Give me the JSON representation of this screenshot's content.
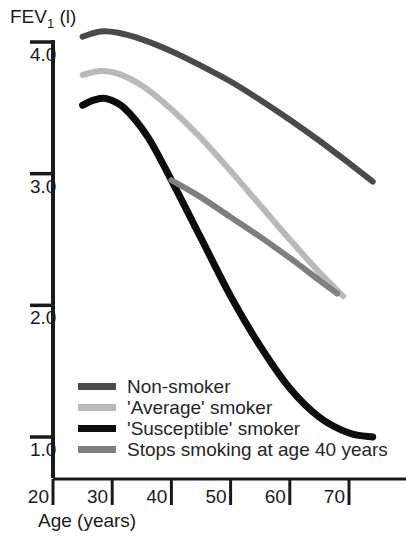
{
  "chart_data": {
    "type": "line",
    "title": "",
    "xlabel": "Age (years)",
    "ylabel": "FEV1 (l)",
    "ylabel_parts": {
      "main": "FEV",
      "sub": "1",
      "units": "(l)"
    },
    "xlim": [
      20,
      74
    ],
    "ylim": [
      1.0,
      4.32
    ],
    "grid": false,
    "legend_position": "inside-lower-left",
    "xticks": [
      20,
      30,
      40,
      50,
      60,
      70
    ],
    "xtick_labels": [
      "20",
      "30",
      "40",
      "50",
      "60",
      "70"
    ],
    "yticks": [
      4.0,
      3.0,
      2.0,
      1.0
    ],
    "ytick_labels": [
      "4.0",
      "3.0",
      "2.0",
      "1.0"
    ],
    "annotations": [
      "Stops smoking branch departs the 'Susceptible' smoker curve at age 40"
    ],
    "series": [
      {
        "name": "Non-smoker",
        "color": "#4a4a4a",
        "width": 6,
        "x": [
          25,
          28,
          31,
          35,
          40,
          45,
          50,
          55,
          60,
          65,
          70,
          74
        ],
        "values": [
          4.04,
          4.08,
          4.07,
          4.02,
          3.93,
          3.82,
          3.7,
          3.56,
          3.41,
          3.25,
          3.08,
          2.94
        ]
      },
      {
        "name": "'Average' smoker",
        "color": "#b9b9b9",
        "width": 6,
        "x": [
          25,
          28,
          31,
          35,
          40,
          45,
          50,
          55,
          60,
          65,
          69
        ],
        "values": [
          3.75,
          3.78,
          3.76,
          3.67,
          3.49,
          3.27,
          3.02,
          2.76,
          2.5,
          2.25,
          2.07
        ]
      },
      {
        "name": "'Susceptible' smoker",
        "color": "#0d0d0d",
        "width": 7,
        "x": [
          25,
          27,
          29,
          32,
          36,
          40,
          45,
          50,
          55,
          60,
          65,
          70,
          74
        ],
        "values": [
          3.52,
          3.56,
          3.57,
          3.5,
          3.28,
          2.95,
          2.51,
          2.07,
          1.69,
          1.37,
          1.15,
          1.03,
          1.0
        ]
      },
      {
        "name": "Stops smoking at age 40 years",
        "color": "#7f7f7f",
        "width": 6,
        "x": [
          40,
          45,
          50,
          55,
          60,
          65,
          68
        ],
        "values": [
          2.95,
          2.82,
          2.67,
          2.52,
          2.36,
          2.19,
          2.09
        ]
      }
    ]
  },
  "legend": {
    "items": [
      {
        "label": "Non-smoker",
        "color": "#4a4a4a"
      },
      {
        "label": "'Average' smoker",
        "color": "#b9b9b9"
      },
      {
        "label": "'Susceptible' smoker",
        "color": "#0d0d0d"
      },
      {
        "label": "Stops smoking at age 40 years",
        "color": "#7f7f7f"
      }
    ]
  },
  "colors": {
    "axis": "#1a1a1a",
    "background": "#ffffff",
    "text": "#1a1a1a"
  }
}
